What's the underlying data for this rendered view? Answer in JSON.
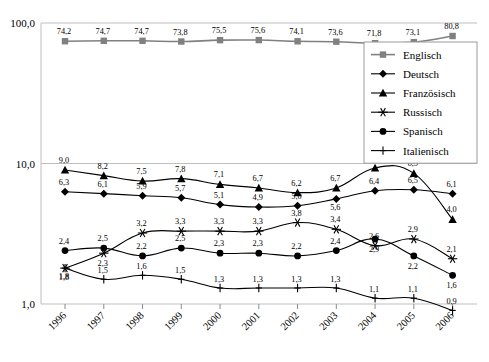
{
  "chart_data": {
    "type": "line",
    "title": "",
    "xlabel": "",
    "ylabel": "",
    "yscale": "log",
    "ylim": [
      1.0,
      100.0
    ],
    "ytick_labels": [
      "100,0",
      "10,0",
      "1,0"
    ],
    "ytick_values": [
      100.0,
      10.0,
      1.0
    ],
    "grid": true,
    "legend_position": "right-top",
    "decimal_separator": ",",
    "categories": [
      "1996",
      "1997",
      "1998",
      "1999",
      "2000",
      "2001",
      "2002",
      "2003",
      "2004",
      "2005",
      "2006"
    ],
    "series": [
      {
        "name": "Englisch",
        "marker": "square",
        "color": "#808080",
        "values": [
          74.2,
          74.7,
          74.7,
          73.8,
          75.5,
          75.6,
          74.1,
          73.6,
          71.8,
          73.1,
          80.8
        ],
        "labels": [
          "74,2",
          "74,7",
          "74,7",
          "73,8",
          "75,5",
          "75,6",
          "74,1",
          "73,6",
          "71,8",
          "73,1",
          "80,8"
        ]
      },
      {
        "name": "Deutsch",
        "marker": "diamond",
        "color": "#000000",
        "values": [
          6.3,
          6.1,
          5.9,
          5.7,
          5.1,
          4.9,
          5.0,
          5.6,
          6.4,
          6.5,
          6.1
        ],
        "labels": [
          "6,3",
          "6,1",
          "5,9",
          "5,7",
          "5,1",
          "4,9",
          "5,0",
          "5,6",
          "6,4",
          "6,5",
          "6,1"
        ]
      },
      {
        "name": "Französisch",
        "marker": "triangle",
        "color": "#000000",
        "values": [
          9.0,
          8.2,
          7.5,
          7.8,
          7.1,
          6.7,
          6.2,
          6.7,
          9.3,
          8.5,
          4.0
        ],
        "labels": [
          "9,0",
          "8,2",
          "7,5",
          "7,8",
          "7,1",
          "6,7",
          "6,2",
          "6,7",
          "9,3",
          "8,5",
          "4,0"
        ]
      },
      {
        "name": "Russisch",
        "marker": "asterisk",
        "color": "#000000",
        "values": [
          1.8,
          2.3,
          3.2,
          3.3,
          3.3,
          3.3,
          3.8,
          3.4,
          2.6,
          2.9,
          2.1
        ],
        "labels": [
          "1,8",
          "2,3",
          "3,2",
          "3,3",
          "3,3",
          "3,3",
          "3,8",
          "3,4",
          "2,6",
          "2,9",
          "2,1"
        ]
      },
      {
        "name": "Spanisch",
        "marker": "circle",
        "color": "#000000",
        "values": [
          2.4,
          2.5,
          2.2,
          2.5,
          2.3,
          2.3,
          2.2,
          2.4,
          2.9,
          2.2,
          1.6
        ],
        "labels": [
          "2,4",
          "2,5",
          "2,2",
          "2,5",
          "2,3",
          "2,3",
          "2,2",
          "2,4",
          "2,9",
          "2,2",
          "1,6"
        ]
      },
      {
        "name": "Italienisch",
        "marker": "plus",
        "color": "#000000",
        "values": [
          1.8,
          1.5,
          1.6,
          1.5,
          1.3,
          1.3,
          1.3,
          1.3,
          1.1,
          1.1,
          0.9
        ],
        "labels": [
          "1,8",
          "1,5",
          "1,6",
          "1,5",
          "1,3",
          "1,3",
          "1,3",
          "1,3",
          "1,1",
          "1,1",
          "0,9"
        ]
      }
    ]
  }
}
